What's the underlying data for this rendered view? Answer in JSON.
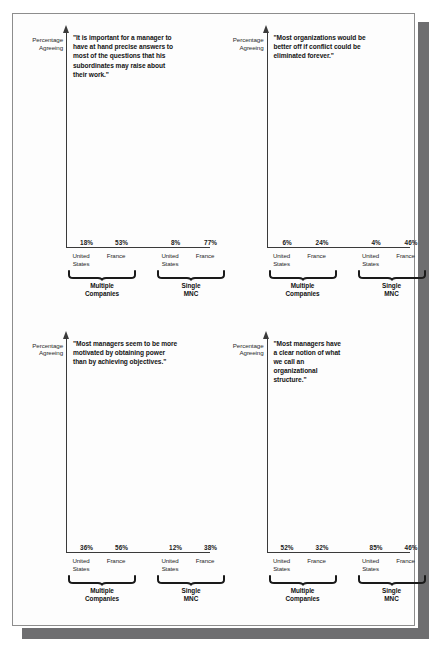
{
  "page": {
    "background_color": "#ffffff",
    "sheet_color": "#fdfdfd",
    "border_color": "#8d8d8d",
    "shadow_color": "#6e6e70"
  },
  "legend_colors": {
    "united_states": "#c9c9c9",
    "france": "#6e6e6e"
  },
  "labels": {
    "axis_label_line1": "Percentage",
    "axis_label_line2": "Agreeing",
    "tick_us_line1": "United",
    "tick_us_line2": "States",
    "tick_france": "France",
    "group_multiple_line1": "Multiple",
    "group_multiple_line2": "Companies",
    "group_single_line1": "Single",
    "group_single_line2": "MNC"
  },
  "chart_data": [
    {
      "id": "chart-top-left",
      "type": "bar",
      "title": "\"It is important for a manager to have at hand precise answers to most of the questions that his subordinates may raise about their work.\"",
      "ylabel": "Percentage Agreeing",
      "xlabel": "",
      "ylim": [
        0,
        100
      ],
      "grid": false,
      "legend": "none",
      "categories": [
        "United States",
        "France",
        "United States",
        "France"
      ],
      "groups": [
        "Multiple Companies",
        "Multiple Companies",
        "Single MNC",
        "Single MNC"
      ],
      "values": [
        18,
        53,
        8,
        77
      ],
      "value_labels": [
        "18%",
        "53%",
        "8%",
        "77%"
      ]
    },
    {
      "id": "chart-top-right",
      "type": "bar",
      "title": "\"Most organizations would be better off if conflict could be eliminated forever.\"",
      "ylabel": "Percentage Agreeing",
      "xlabel": "",
      "ylim": [
        0,
        100
      ],
      "grid": false,
      "legend": "none",
      "categories": [
        "United States",
        "France",
        "United States",
        "France"
      ],
      "groups": [
        "Multiple Companies",
        "Multiple Companies",
        "Single MNC",
        "Single MNC"
      ],
      "values": [
        6,
        24,
        4,
        46
      ],
      "value_labels": [
        "6%",
        "24%",
        "4%",
        "46%"
      ]
    },
    {
      "id": "chart-bottom-left",
      "type": "bar",
      "title": "\"Most managers seem to be more motivated by obtaining power than by achieving objectives.\"",
      "ylabel": "Percentage Agreeing",
      "xlabel": "",
      "ylim": [
        0,
        100
      ],
      "grid": false,
      "legend": "none",
      "categories": [
        "United States",
        "France",
        "United States",
        "France"
      ],
      "groups": [
        "Multiple Companies",
        "Multiple Companies",
        "Single MNC",
        "Single MNC"
      ],
      "values": [
        36,
        56,
        12,
        38
      ],
      "value_labels": [
        "36%",
        "56%",
        "12%",
        "38%"
      ]
    },
    {
      "id": "chart-bottom-right",
      "type": "bar",
      "title": "\"Most managers have a clear notion of what we call an organizational structure.\"",
      "ylabel": "Percentage Agreeing",
      "xlabel": "",
      "ylim": [
        0,
        100
      ],
      "grid": false,
      "legend": "none",
      "categories": [
        "United States",
        "France",
        "United States",
        "France"
      ],
      "groups": [
        "Multiple Companies",
        "Multiple Companies",
        "Single MNC",
        "Single MNC"
      ],
      "values": [
        52,
        32,
        85,
        46
      ],
      "value_labels": [
        "52%",
        "32%",
        "85%",
        "46%"
      ]
    }
  ]
}
